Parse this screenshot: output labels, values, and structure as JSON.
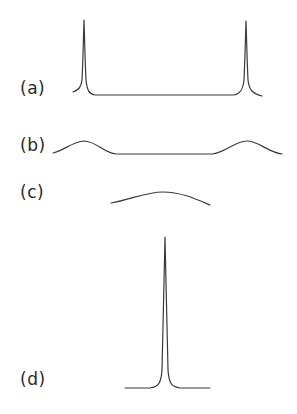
{
  "figure": {
    "panels": [
      {
        "id": "a",
        "label": "(a)",
        "description": "Two sharp narrow peaks at both ends connected by a flat baseline"
      },
      {
        "id": "b",
        "label": "(b)",
        "description": "Two broad low humps at both ends connected by a flat baseline"
      },
      {
        "id": "c",
        "label": "(c)",
        "description": "Single broad low hump"
      },
      {
        "id": "d",
        "label": "(d)",
        "description": "Single very sharp tall central peak on a flat baseline"
      }
    ],
    "stroke_color": "#3a3a3a",
    "background_color": "#ffffff"
  }
}
